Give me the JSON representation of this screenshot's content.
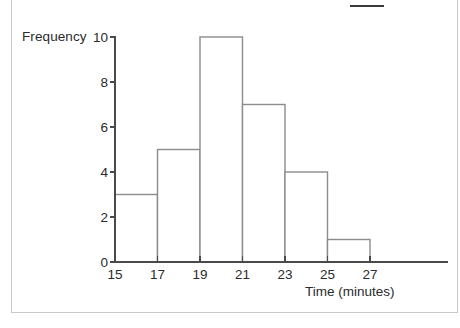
{
  "chart_data": {
    "type": "bar",
    "title": "",
    "subtitle": "",
    "xlabel": "Time (minutes)",
    "ylabel": "Frequency",
    "categories": [
      "15-17",
      "17-19",
      "19-21",
      "21-23",
      "23-25",
      "25-27"
    ],
    "bin_edges": [
      15,
      17,
      19,
      21,
      23,
      25,
      27
    ],
    "values": [
      3,
      5,
      10,
      7,
      4,
      1
    ],
    "xlim": [
      15,
      29
    ],
    "ylim": [
      0,
      10
    ],
    "x_ticks": [
      15,
      17,
      19,
      21,
      23,
      25,
      27
    ],
    "x_tick_labels": [
      "15",
      "17",
      "19",
      "21",
      "23",
      "25",
      "27"
    ],
    "y_ticks": [
      0,
      2,
      4,
      6,
      8,
      10
    ],
    "y_tick_labels": [
      "0",
      "2",
      "4",
      "6",
      "8",
      "10"
    ],
    "grid": false,
    "legend": null,
    "bar_fill": "#ffffff",
    "bar_stroke": "#8c8c8c",
    "axis_color": "#4a4a4a"
  },
  "annotations": {
    "top_rule": "horizontal-rule-mark"
  }
}
